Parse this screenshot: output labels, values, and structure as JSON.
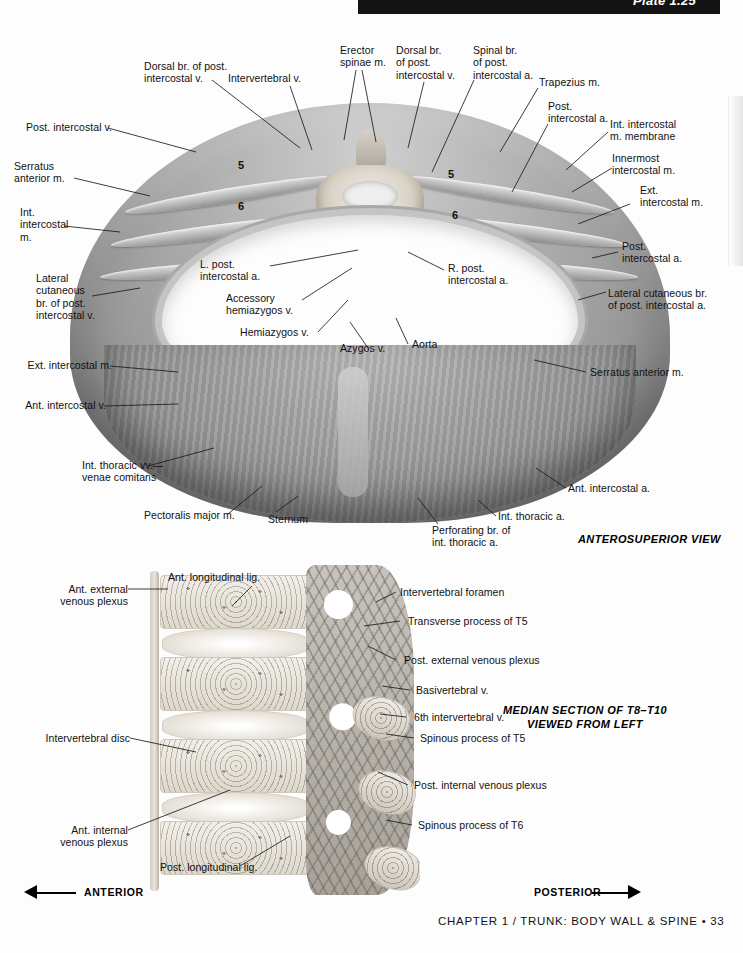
{
  "page": {
    "plate_label": "Plate 1.25",
    "footer": "CHAPTER 1 / TRUNK: BODY WALL & SPINE • 33"
  },
  "figure_top": {
    "caption": "ANTEROSUPERIOR VIEW",
    "rib_numbers": [
      "5",
      "6",
      "5",
      "6"
    ],
    "labels": [
      {
        "id": "post-intercostal-v",
        "text": "Post. intercostal v."
      },
      {
        "id": "serratus-anterior-m-left",
        "text": "Serratus\nanterior m."
      },
      {
        "id": "int-intercostal-m",
        "text": "Int.\nintercostal\nm."
      },
      {
        "id": "lateral-cutaneous-br-post-intercostal-v",
        "text": "Lateral\ncutaneous\nbr. of post.\nintercostal v."
      },
      {
        "id": "ext-intercostal-m-left",
        "text": "Ext. intercostal m."
      },
      {
        "id": "ant-intercostal-v",
        "text": "Ant. intercostal v."
      },
      {
        "id": "int-thoracic-vv",
        "text": "Int. thoracic vv.—\nvenae comitans"
      },
      {
        "id": "pectoralis-major-m",
        "text": "Pectoralis major m."
      },
      {
        "id": "sternum",
        "text": "Sternum"
      },
      {
        "id": "dorsal-br-post-intercostal-v-left",
        "text": "Dorsal br. of post.\nintercostal v."
      },
      {
        "id": "intervertebral-v",
        "text": "Intervertebral v."
      },
      {
        "id": "erector-spinae-m",
        "text": "Erector\nspinae m."
      },
      {
        "id": "dorsal-br-post-intercostal-v-right",
        "text": "Dorsal br.\nof post.\nintercostal v."
      },
      {
        "id": "spinal-br-post-intercostal-a",
        "text": "Spinal br.\nof post.\nintercostal a."
      },
      {
        "id": "trapezius-m",
        "text": "Trapezius m."
      },
      {
        "id": "post-intercostal-a-upper",
        "text": "Post.\nintercostal a."
      },
      {
        "id": "int-intercostal-m-membrane",
        "text": "Int. intercostal\nm. membrane"
      },
      {
        "id": "innermost-intercostal-m",
        "text": "Innermost\nintercostal m."
      },
      {
        "id": "ext-intercostal-m-right",
        "text": "Ext.\nintercostal m."
      },
      {
        "id": "post-intercostal-a-lower",
        "text": "Post.\nintercostal a."
      },
      {
        "id": "lateral-cutaneous-br-post-intercostal-a",
        "text": "Lateral cutaneous br.\nof post. intercostal a."
      },
      {
        "id": "serratus-anterior-m-right",
        "text": "Serratus anterior m."
      },
      {
        "id": "l-post-intercostal-a",
        "text": "L. post.\nintercostal a."
      },
      {
        "id": "accessory-hemiazygos-v",
        "text": "Accessory\nhemiazygos v."
      },
      {
        "id": "hemiazygos-v",
        "text": "Hemiazygos v."
      },
      {
        "id": "azygos-v",
        "text": "Azygos v."
      },
      {
        "id": "aorta",
        "text": "Aorta"
      },
      {
        "id": "r-post-intercostal-a",
        "text": "R. post.\nintercostal a."
      },
      {
        "id": "ant-intercostal-a",
        "text": "Ant. intercostal a."
      },
      {
        "id": "int-thoracic-a",
        "text": "Int. thoracic a."
      },
      {
        "id": "perforating-br-int-thoracic-a",
        "text": "Perforating br. of\nint. thoracic a."
      }
    ]
  },
  "figure_bottom": {
    "caption": "MEDIAN SECTION OF T8–T10\nVIEWED FROM LEFT",
    "direction_left": "ANTERIOR",
    "direction_right": "POSTERIOR",
    "labels": [
      {
        "id": "ant-external-venous-plexus",
        "text": "Ant. external\nvenous plexus"
      },
      {
        "id": "ant-longitudinal-lig",
        "text": "Ant. longitudinal lig."
      },
      {
        "id": "intervertebral-disc",
        "text": "Intervertebral disc"
      },
      {
        "id": "ant-internal-venous-plexus",
        "text": "Ant. internal\nvenous plexus"
      },
      {
        "id": "post-longitudinal-lig",
        "text": "Post. longitudinal lig."
      },
      {
        "id": "intervertebral-foramen",
        "text": "Intervertebral foramen"
      },
      {
        "id": "transverse-process-t5",
        "text": "Transverse process of T5"
      },
      {
        "id": "post-external-venous-plexus",
        "text": "Post. external venous plexus"
      },
      {
        "id": "basivertebral-v",
        "text": "Basivertebral v."
      },
      {
        "id": "sixth-intervertebral-v",
        "text": "6th intervertebral v."
      },
      {
        "id": "spinous-process-t5",
        "text": "Spinous process of T5"
      },
      {
        "id": "post-internal-venous-plexus",
        "text": "Post. internal venous plexus"
      },
      {
        "id": "spinous-process-t6",
        "text": "Spinous process of T6"
      }
    ]
  }
}
